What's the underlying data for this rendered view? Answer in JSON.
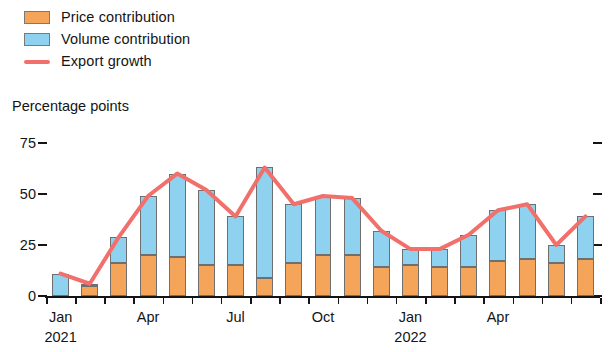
{
  "legend": {
    "items": [
      {
        "label": "Price contribution",
        "type": "swatch",
        "color": "#f5a55a",
        "name": "legend-price-contribution"
      },
      {
        "label": "Volume contribution",
        "type": "swatch",
        "color": "#8ed2ef",
        "name": "legend-volume-contribution"
      },
      {
        "label": "Export growth",
        "type": "line",
        "color": "#f2706b",
        "name": "legend-export-growth"
      }
    ]
  },
  "axis_title": "Percentage points",
  "chart_data": {
    "type": "bar",
    "title": "",
    "subtitle": "",
    "xlabel": "",
    "ylabel": "Percentage points",
    "ylim": [
      0,
      75
    ],
    "yticks": [
      0,
      25,
      50,
      75
    ],
    "ytick_labels": [
      "0",
      "25",
      "50",
      "75"
    ],
    "grid": false,
    "legend_position": "top-left",
    "stacked": true,
    "categories": [
      "Jan 2021",
      "Feb 2021",
      "Mar 2021",
      "Apr 2021",
      "May 2021",
      "Jun 2021",
      "Jul 2021",
      "Aug 2021",
      "Sep 2021",
      "Oct 2021",
      "Nov 2021",
      "Dec 2021",
      "Jan 2022",
      "Feb 2022",
      "Mar 2022",
      "Apr 2022",
      "May 2022",
      "Jun 2022",
      "Jul 2022"
    ],
    "xtick_labels": [
      {
        "label": "Jan",
        "year": "2021",
        "category_index": 0
      },
      {
        "label": "Apr",
        "year": "",
        "category_index": 3
      },
      {
        "label": "Jul",
        "year": "",
        "category_index": 6
      },
      {
        "label": "Oct",
        "year": "",
        "category_index": 9
      },
      {
        "label": "Jan",
        "year": "2022",
        "category_index": 12
      },
      {
        "label": "Apr",
        "year": "",
        "category_index": 15
      }
    ],
    "series": [
      {
        "name": "Price contribution",
        "color": "#f5a55a",
        "values": [
          0,
          5,
          16,
          20,
          19,
          15,
          15,
          9,
          16,
          20,
          20,
          14,
          15,
          14,
          14,
          17,
          18,
          16,
          18
        ]
      },
      {
        "name": "Volume contribution",
        "color": "#8ed2ef",
        "values": [
          11,
          1,
          13,
          29,
          41,
          37,
          24,
          54,
          29,
          29,
          28,
          18,
          8,
          9,
          16,
          25,
          27,
          9,
          21
        ]
      },
      {
        "name": "Export growth",
        "color": "#f2706b",
        "type": "line",
        "values": [
          11,
          6,
          29,
          49,
          60,
          52,
          39,
          63,
          45,
          49,
          48,
          32,
          23,
          23,
          30,
          42,
          45,
          25,
          39
        ]
      }
    ]
  }
}
